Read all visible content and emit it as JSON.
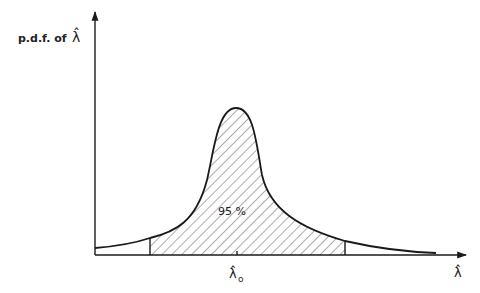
{
  "diagram": {
    "type": "probability-density-function",
    "y_axis_label": "p.d.f. of λ̂",
    "y_axis_label_prefix": "p.d.f. of",
    "y_axis_symbol": "λ̂",
    "x_axis_symbol": "λ̂",
    "center_label": "λ̂",
    "center_subscript": "o",
    "shaded_region_label": "95 %",
    "shaded_fraction": 0.95,
    "colors": {
      "line": "#1a1a1a",
      "hatch": "#555555",
      "text": "#222222",
      "background": "#ffffff"
    }
  }
}
